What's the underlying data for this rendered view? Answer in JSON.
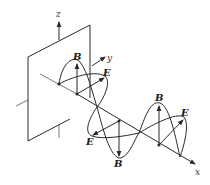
{
  "figure": {
    "labels": {
      "z_axis": "z",
      "y_axis": "y",
      "x_axis": "x",
      "magnetic_field": "B",
      "electric_field": "E"
    },
    "field_vectors": [
      {
        "id": 1,
        "B_direction": "up",
        "E_direction": "toward +y",
        "B_label": "B",
        "E_label": "E"
      },
      {
        "id": 2,
        "B_direction": "down",
        "E_direction": "toward -y",
        "B_label": "B",
        "E_label": "E"
      },
      {
        "id": 3,
        "B_direction": "up",
        "E_direction": "toward +y",
        "B_label": "B",
        "E_label": "E"
      }
    ],
    "colors": {
      "line": "#2a2a2a",
      "background": "#ffffff"
    }
  }
}
